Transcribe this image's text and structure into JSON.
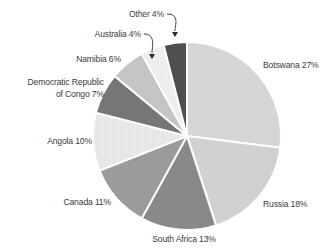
{
  "chart_data": {
    "type": "pie",
    "title": "",
    "subtitle": "",
    "xlabel": "",
    "ylabel": "",
    "legend_position": "none",
    "grid": false,
    "label_format": "{name} {value}%",
    "units": "percent",
    "total": 100,
    "start_angle_deg": 0,
    "direction": "clockwise",
    "categories": [
      "Botswana",
      "Russia",
      "South Africa",
      "Canada",
      "Angola",
      "Democratic Republic of Congo",
      "Namibia",
      "Australia",
      "Other"
    ],
    "values": [
      27,
      18,
      13,
      11,
      10,
      7,
      6,
      4,
      4
    ],
    "slices": [
      {
        "name": "Botswana",
        "value": 27,
        "label": "Botswana 27%",
        "color": "#d7d7d7",
        "label_x": 263,
        "label_y": 68,
        "anchor": "start",
        "leader": false
      },
      {
        "name": "Russia",
        "value": 18,
        "label": "Russia 18%",
        "color": "#d2d2d2",
        "label_x": 263,
        "label_y": 207,
        "anchor": "start",
        "leader": false
      },
      {
        "name": "South Africa",
        "value": 13,
        "label": "South Africa 13%",
        "color": "#8a8a8a",
        "label_x": 184,
        "label_y": 242,
        "anchor": "middle",
        "leader": false
      },
      {
        "name": "Canada",
        "value": 11,
        "label": "Canada 11%",
        "color": "#9c9c9c",
        "label_x": 111,
        "label_y": 205,
        "anchor": "end",
        "leader": false
      },
      {
        "name": "Angola",
        "value": 10,
        "label": "Angola 10%",
        "color": "#e9e9e9",
        "label_x": 92,
        "label_y": 144,
        "anchor": "end",
        "leader": false
      },
      {
        "name": "Democratic Republic of Congo",
        "value": 7,
        "label": "Democratic Republic",
        "label_line2": "of Congo 7%",
        "color": "#777777",
        "label_x": 104,
        "label_y": 85,
        "anchor": "end",
        "leader": false
      },
      {
        "name": "Namibia",
        "value": 6,
        "label": "Namibia 6%",
        "color": "#c6c6c6",
        "label_x": 121,
        "label_y": 62,
        "anchor": "end",
        "leader": false
      },
      {
        "name": "Australia",
        "value": 4,
        "label": "Australia 4%",
        "color": "#f0f0f0",
        "label_x": 141,
        "label_y": 37,
        "anchor": "end",
        "leader": true
      },
      {
        "name": "Other",
        "value": 4,
        "label": "Other 4%",
        "color": "#4f4f4f",
        "label_x": 164,
        "label_y": 17,
        "anchor": "end",
        "leader": true
      }
    ],
    "geometry": {
      "cx": 187,
      "cy": 136,
      "r": 94,
      "separator_color": "#ffffff",
      "separator_width": 2
    },
    "leaders": [
      {
        "for": "Australia",
        "path": "M144,34 C156,34 152,47 152,53",
        "arrow_x": 152,
        "arrow_y": 59
      },
      {
        "for": "Other",
        "path": "M167,14 C180,14 175,25 175,31",
        "arrow_x": 175,
        "arrow_y": 37
      }
    ]
  },
  "page": {
    "background": "#ffffff",
    "text_color": "#3b3b3b"
  }
}
